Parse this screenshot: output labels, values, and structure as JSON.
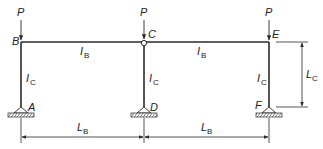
{
  "diagram": {
    "type": "structural-frame",
    "colors": {
      "stroke": "#2a2a2a",
      "text": "#222222",
      "hinge_fill": "#ffffff",
      "hatch": "#555555"
    },
    "loads": [
      {
        "label": "P",
        "at_node": "B"
      },
      {
        "label": "P",
        "at_node": "C"
      },
      {
        "label": "P",
        "at_node": "E"
      }
    ],
    "nodes": {
      "B": "B",
      "C": "C",
      "E": "E",
      "A": "A",
      "D": "D",
      "F": "F"
    },
    "members": {
      "beam_left": {
        "main": "I",
        "sub": "B"
      },
      "beam_right": {
        "main": "I",
        "sub": "B"
      },
      "col_left": {
        "main": "I",
        "sub": "C"
      },
      "col_mid": {
        "main": "I",
        "sub": "C"
      },
      "col_right": {
        "main": "I",
        "sub": "C"
      }
    },
    "dimensions": {
      "span_left": {
        "main": "L",
        "sub": "B"
      },
      "span_right": {
        "main": "L",
        "sub": "B"
      },
      "height": {
        "main": "L",
        "sub": "C"
      }
    },
    "hinge_node": "C",
    "supports": [
      "A",
      "D",
      "F"
    ]
  }
}
